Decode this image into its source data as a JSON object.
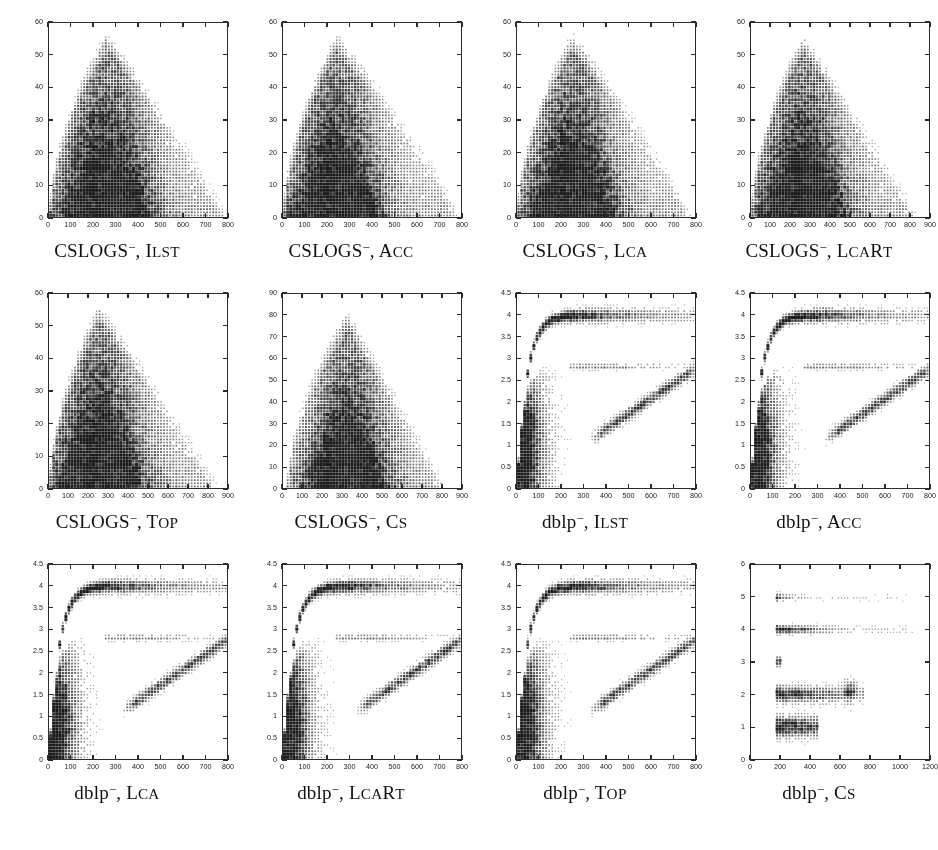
{
  "figure": {
    "title": "",
    "rows": 3,
    "cols": 4,
    "panel_count": 12
  },
  "chart_data": [
    {
      "type": "scatter",
      "title": "CSLOGS-, ILST",
      "caption_dataset": "CSLOGS",
      "caption_sup": "−",
      "caption_method": "Ilst",
      "xlabel": "",
      "ylabel": "",
      "xlim": [
        0,
        800
      ],
      "ylim": [
        0,
        60
      ],
      "xticks": [
        0,
        100,
        200,
        300,
        400,
        500,
        600,
        700,
        800
      ],
      "yticks": [
        0,
        10,
        20,
        30,
        40,
        50,
        60
      ],
      "grid": false,
      "legend": "none",
      "density_profile": "cslogs_ilst"
    },
    {
      "type": "scatter",
      "title": "CSLOGS-, Acc",
      "caption_dataset": "CSLOGS",
      "caption_sup": "−",
      "caption_method": "Acc",
      "xlabel": "",
      "ylabel": "",
      "xlim": [
        0,
        800
      ],
      "ylim": [
        0,
        60
      ],
      "xticks": [
        0,
        100,
        200,
        300,
        400,
        500,
        600,
        700,
        800
      ],
      "yticks": [
        0,
        10,
        20,
        30,
        40,
        50,
        60
      ],
      "grid": false,
      "legend": "none",
      "density_profile": "cslogs_acc"
    },
    {
      "type": "scatter",
      "title": "CSLOGS-, Lca",
      "caption_dataset": "CSLOGS",
      "caption_sup": "−",
      "caption_method": "Lca",
      "xlabel": "",
      "ylabel": "",
      "xlim": [
        0,
        800
      ],
      "ylim": [
        0,
        60
      ],
      "xticks": [
        0,
        100,
        200,
        300,
        400,
        500,
        600,
        700,
        800
      ],
      "yticks": [
        0,
        10,
        20,
        30,
        40,
        50,
        60
      ],
      "grid": false,
      "legend": "none",
      "density_profile": "cslogs_lca"
    },
    {
      "type": "scatter",
      "title": "CSLOGS-, LcaRt",
      "caption_dataset": "CSLOGS",
      "caption_sup": "−",
      "caption_method": "LcaRt",
      "xlabel": "",
      "ylabel": "",
      "xlim": [
        0,
        900
      ],
      "ylim": [
        0,
        60
      ],
      "xticks": [
        0,
        100,
        200,
        300,
        400,
        500,
        600,
        700,
        800,
        900
      ],
      "yticks": [
        0,
        10,
        20,
        30,
        40,
        50,
        60
      ],
      "grid": false,
      "legend": "none",
      "density_profile": "cslogs_lcart"
    },
    {
      "type": "scatter",
      "title": "CSLOGS-, Top",
      "caption_dataset": "CSLOGS",
      "caption_sup": "−",
      "caption_method": "Top",
      "xlabel": "",
      "ylabel": "",
      "xlim": [
        0,
        900
      ],
      "ylim": [
        0,
        60
      ],
      "xticks": [
        0,
        100,
        200,
        300,
        400,
        500,
        600,
        700,
        800,
        900
      ],
      "yticks": [
        0,
        10,
        20,
        30,
        40,
        50,
        60
      ],
      "grid": false,
      "legend": "none",
      "density_profile": "cslogs_top"
    },
    {
      "type": "scatter",
      "title": "CSLOGS-, Cs",
      "caption_dataset": "CSLOGS",
      "caption_sup": "−",
      "caption_method": "Cs",
      "xlabel": "",
      "ylabel": "",
      "xlim": [
        0,
        900
      ],
      "ylim": [
        0,
        90
      ],
      "xticks": [
        0,
        100,
        200,
        300,
        400,
        500,
        600,
        700,
        800,
        900
      ],
      "yticks": [
        0,
        10,
        20,
        30,
        40,
        50,
        60,
        70,
        80,
        90
      ],
      "grid": false,
      "legend": "none",
      "density_profile": "cslogs_cs"
    },
    {
      "type": "scatter",
      "title": "dblp-, ILST",
      "caption_dataset": "dblp",
      "caption_sup": "−",
      "caption_method": "Ilst",
      "xlabel": "",
      "ylabel": "",
      "xlim": [
        0,
        800
      ],
      "ylim": [
        0,
        4.5
      ],
      "xticks": [
        0,
        100,
        200,
        300,
        400,
        500,
        600,
        700,
        800
      ],
      "yticks": [
        0,
        0.5,
        1,
        1.5,
        2,
        2.5,
        3,
        3.5,
        4,
        4.5
      ],
      "grid": false,
      "legend": "none",
      "density_profile": "dblp_std"
    },
    {
      "type": "scatter",
      "title": "dblp-, Acc",
      "caption_dataset": "dblp",
      "caption_sup": "−",
      "caption_method": "Acc",
      "xlabel": "",
      "ylabel": "",
      "xlim": [
        0,
        800
      ],
      "ylim": [
        0,
        4.5
      ],
      "xticks": [
        0,
        100,
        200,
        300,
        400,
        500,
        600,
        700,
        800
      ],
      "yticks": [
        0,
        0.5,
        1,
        1.5,
        2,
        2.5,
        3,
        3.5,
        4,
        4.5
      ],
      "grid": false,
      "legend": "none",
      "density_profile": "dblp_std"
    },
    {
      "type": "scatter",
      "title": "dblp-, Lca",
      "caption_dataset": "dblp",
      "caption_sup": "−",
      "caption_method": "Lca",
      "xlabel": "",
      "ylabel": "",
      "xlim": [
        0,
        800
      ],
      "ylim": [
        0,
        4.5
      ],
      "xticks": [
        0,
        100,
        200,
        300,
        400,
        500,
        600,
        700,
        800
      ],
      "yticks": [
        0,
        0.5,
        1,
        1.5,
        2,
        2.5,
        3,
        3.5,
        4,
        4.5
      ],
      "grid": false,
      "legend": "none",
      "density_profile": "dblp_std"
    },
    {
      "type": "scatter",
      "title": "dblp-, LcaRt",
      "caption_dataset": "dblp",
      "caption_sup": "−",
      "caption_method": "LcaRt",
      "xlabel": "",
      "ylabel": "",
      "xlim": [
        0,
        800
      ],
      "ylim": [
        0,
        4.5
      ],
      "xticks": [
        0,
        100,
        200,
        300,
        400,
        500,
        600,
        700,
        800
      ],
      "yticks": [
        0,
        0.5,
        1,
        1.5,
        2,
        2.5,
        3,
        3.5,
        4,
        4.5
      ],
      "grid": false,
      "legend": "none",
      "density_profile": "dblp_std"
    },
    {
      "type": "scatter",
      "title": "dblp-, Top",
      "caption_dataset": "dblp",
      "caption_sup": "−",
      "caption_method": "Top",
      "xlabel": "",
      "ylabel": "",
      "xlim": [
        0,
        800
      ],
      "ylim": [
        0,
        4.5
      ],
      "xticks": [
        0,
        100,
        200,
        300,
        400,
        500,
        600,
        700,
        800
      ],
      "yticks": [
        0,
        0.5,
        1,
        1.5,
        2,
        2.5,
        3,
        3.5,
        4,
        4.5
      ],
      "grid": false,
      "legend": "none",
      "density_profile": "dblp_std"
    },
    {
      "type": "scatter",
      "title": "dblp-, Cs",
      "caption_dataset": "dblp",
      "caption_sup": "−",
      "caption_method": "Cs",
      "xlabel": "",
      "ylabel": "",
      "xlim": [
        0,
        1200
      ],
      "ylim": [
        0,
        6
      ],
      "xticks": [
        0,
        200,
        400,
        600,
        800,
        1000,
        1200
      ],
      "yticks": [
        0,
        1,
        2,
        3,
        4,
        5,
        6
      ],
      "grid": false,
      "legend": "none",
      "density_profile": "dblp_cs"
    }
  ],
  "style": {
    "marker_color": "#1a1a1a",
    "frame_color": "#2b2b2b",
    "background": "#ffffff"
  }
}
